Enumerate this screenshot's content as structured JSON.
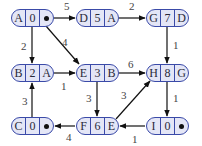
{
  "diagram": {
    "type": "weighted-directed-graph-predecessor-table",
    "colors": {
      "node_fill": "#e4e6f6",
      "node_border": "#3a4aa8",
      "edge": "#111111"
    },
    "nodes": [
      {
        "id": "A",
        "name": "A",
        "dist": "0",
        "pred": "•",
        "x": 11,
        "y": 9
      },
      {
        "id": "D",
        "name": "D",
        "dist": "5",
        "pred": "A",
        "x": 76,
        "y": 9
      },
      {
        "id": "G",
        "name": "G",
        "dist": "7",
        "pred": "D",
        "x": 146,
        "y": 9
      },
      {
        "id": "B",
        "name": "B",
        "dist": "2",
        "pred": "A",
        "x": 11,
        "y": 64
      },
      {
        "id": "E",
        "name": "E",
        "dist": "3",
        "pred": "B",
        "x": 76,
        "y": 64
      },
      {
        "id": "H",
        "name": "H",
        "dist": "8",
        "pred": "G",
        "x": 146,
        "y": 64
      },
      {
        "id": "C",
        "name": "C",
        "dist": "0",
        "pred": "•",
        "x": 11,
        "y": 117
      },
      {
        "id": "F",
        "name": "F",
        "dist": "6",
        "pred": "E",
        "x": 76,
        "y": 117
      },
      {
        "id": "I",
        "name": "I",
        "dist": "0",
        "pred": "•",
        "x": 146,
        "y": 117
      }
    ],
    "edges": [
      {
        "from": "A",
        "to": "D",
        "weight": "5"
      },
      {
        "from": "D",
        "to": "G",
        "weight": "2"
      },
      {
        "from": "A",
        "to": "B",
        "weight": "2"
      },
      {
        "from": "A",
        "to": "E",
        "weight": "4"
      },
      {
        "from": "G",
        "to": "H",
        "weight": "1"
      },
      {
        "from": "B",
        "to": "E",
        "weight": "1"
      },
      {
        "from": "E",
        "to": "H",
        "weight": "6"
      },
      {
        "from": "E",
        "to": "F",
        "weight": "3"
      },
      {
        "from": "F",
        "to": "H",
        "weight": "3"
      },
      {
        "from": "H",
        "to": "I",
        "weight": "1"
      },
      {
        "from": "C",
        "to": "B",
        "weight": "3"
      },
      {
        "from": "F",
        "to": "C",
        "weight": "4"
      },
      {
        "from": "I",
        "to": "F",
        "weight": "1"
      }
    ]
  }
}
